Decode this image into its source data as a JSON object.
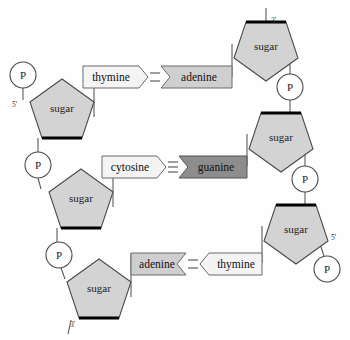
{
  "diagram": {
    "colors": {
      "sugar_fill": "#d3d3d3",
      "base_light_fill": "#f4f4f4",
      "base_mid_fill": "#cfcfcf",
      "base_dark_fill": "#8d8d8d",
      "stroke": "#4a4a4a",
      "thick_edge": "#000000",
      "background": "#fefefe"
    },
    "left_strand": {
      "name": "left-strand",
      "direction_top_label": "5'",
      "direction_bottom_label": "3'",
      "sugars": [
        {
          "label": "sugar",
          "id": "left-sugar-1"
        },
        {
          "label": "sugar",
          "id": "left-sugar-2"
        },
        {
          "label": "sugar",
          "id": "left-sugar-3"
        }
      ],
      "phosphates": [
        {
          "label": "P",
          "id": "left-phosphate-1"
        },
        {
          "label": "P",
          "id": "left-phosphate-2"
        },
        {
          "label": "P",
          "id": "left-phosphate-3"
        }
      ]
    },
    "right_strand": {
      "name": "right-strand",
      "direction_top_label": "3'",
      "direction_bottom_label": "5'",
      "sugars": [
        {
          "label": "sugar",
          "id": "right-sugar-1"
        },
        {
          "label": "sugar",
          "id": "right-sugar-2"
        },
        {
          "label": "sugar",
          "id": "right-sugar-3"
        }
      ],
      "phosphates": [
        {
          "label": "P",
          "id": "right-phosphate-1"
        },
        {
          "label": "P",
          "id": "right-phosphate-2"
        }
      ]
    },
    "base_pairs": [
      {
        "id": "base-pair-1",
        "left_base": "thymine",
        "right_base": "adenine",
        "bonds": 2,
        "arrow_direction": "right",
        "left_fill": "light",
        "right_fill": "mid"
      },
      {
        "id": "base-pair-2",
        "left_base": "cytosine",
        "right_base": "guanine",
        "bonds": 3,
        "arrow_direction": "right",
        "left_fill": "light",
        "right_fill": "dark"
      },
      {
        "id": "base-pair-3",
        "left_base": "adenine",
        "right_base": "thymine",
        "bonds": 2,
        "arrow_direction": "left",
        "left_fill": "mid",
        "right_fill": "light"
      }
    ]
  }
}
